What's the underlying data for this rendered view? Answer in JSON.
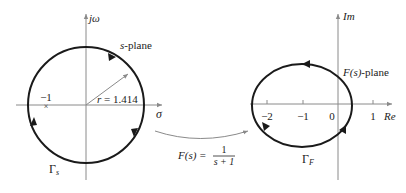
{
  "s_plane": {
    "vertical_axis_label": "jω",
    "horizontal_axis_label": "σ",
    "plane_label_var": "s",
    "plane_label_suffix": "-plane",
    "pole_label": "−1",
    "radius_label": "r = 1.414",
    "contour_label": "Γ",
    "contour_subscript": "s"
  },
  "mapping": {
    "function_lhs": "F(s) =",
    "numerator": "1",
    "denominator": "s + 1"
  },
  "f_plane": {
    "vertical_axis_label": "Im",
    "horizontal_axis_label": "Re",
    "plane_label_var": "F(s)",
    "plane_label_suffix": "-plane",
    "ticks": [
      "−2",
      "−1",
      "0",
      "1"
    ],
    "contour_label": "Γ",
    "contour_subscript": "F"
  },
  "colors": {
    "contour": "#1a1a1a",
    "axis": "#8a8a8a"
  }
}
